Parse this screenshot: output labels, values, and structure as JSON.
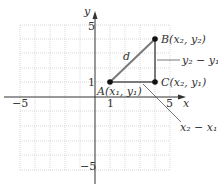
{
  "diagram": {
    "axes": {
      "x_label": "x",
      "y_label": "y",
      "x_ticks": [
        {
          "value": -5,
          "label": "−5"
        },
        {
          "value": 1,
          "label": "1"
        },
        {
          "value": 5,
          "label": "5"
        }
      ],
      "y_ticks": [
        {
          "value": 5,
          "label": "5"
        },
        {
          "value": 1,
          "label": "1"
        },
        {
          "value": -5,
          "label": "−5"
        }
      ],
      "range": [
        -5,
        5
      ]
    },
    "points": {
      "A": {
        "label": "A(x₁, y₁)",
        "coords": [
          1,
          1
        ]
      },
      "B": {
        "label": "B(x₂, y₂)",
        "coords": [
          4,
          4
        ]
      },
      "C": {
        "label": "C(x₂, y₁)",
        "coords": [
          4,
          1
        ]
      }
    },
    "annotations": {
      "distance": "d",
      "vertical_leg": "y₂ − y₁",
      "horizontal_leg": "x₂ − x₁"
    },
    "colors": {
      "triangle": "#7a7a7a",
      "grid": "#cfcfcf",
      "axis": "#333333"
    }
  }
}
